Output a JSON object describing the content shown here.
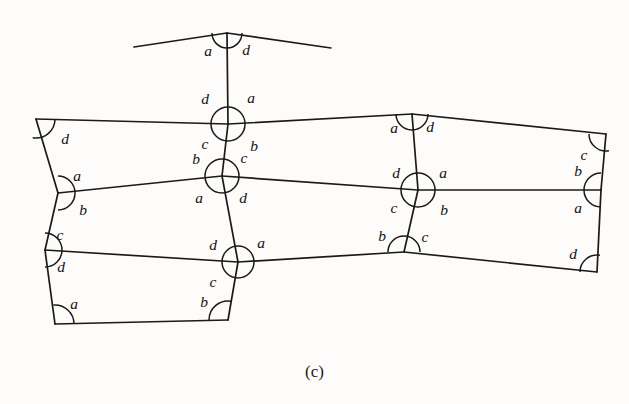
{
  "figure": {
    "caption": "(c)",
    "caption_x": 315,
    "caption_y": 362,
    "width": 629,
    "height": 404,
    "background_color": "#fdfcfa",
    "stroke_color": "#1a1a1a",
    "label_color": "#121212"
  },
  "chart_data": {
    "type": "diagram",
    "title": "(c)",
    "angle_label_set": [
      "a",
      "b",
      "c",
      "d"
    ],
    "nodes": [
      {
        "id": "P",
        "x": 227,
        "y": 33,
        "mark": "semicircle-down",
        "r": 15
      },
      {
        "id": "TL",
        "x": 36,
        "y": 119,
        "mark": "quarter-arc-br",
        "r": 19
      },
      {
        "id": "T1",
        "x": 228,
        "y": 124,
        "mark": "circle",
        "r": 17
      },
      {
        "id": "T2",
        "x": 412,
        "y": 114,
        "mark": "semicircle-down",
        "r": 16
      },
      {
        "id": "TR",
        "x": 606,
        "y": 134,
        "mark": "quarter-arc-bl",
        "r": 17
      },
      {
        "id": "ML",
        "x": 58,
        "y": 193,
        "mark": "semicircle-right",
        "r": 17
      },
      {
        "id": "M1",
        "x": 222,
        "y": 176,
        "mark": "circle",
        "r": 17
      },
      {
        "id": "M2",
        "x": 418,
        "y": 190,
        "mark": "circle",
        "r": 17
      },
      {
        "id": "MR",
        "x": 601,
        "y": 190,
        "mark": "semicircle-left",
        "r": 17
      },
      {
        "id": "BL",
        "x": 45,
        "y": 250,
        "mark": "semicircle-right",
        "r": 17
      },
      {
        "id": "B1",
        "x": 238,
        "y": 262,
        "mark": "circle",
        "r": 16
      },
      {
        "id": "B2",
        "x": 404,
        "y": 252,
        "mark": "semicircle-up",
        "r": 16
      },
      {
        "id": "BR",
        "x": 597,
        "y": 272,
        "mark": "quarter-arc-tl",
        "r": 17
      },
      {
        "id": "BBL",
        "x": 55,
        "y": 324,
        "mark": "quarter-arc-tr",
        "r": 19
      },
      {
        "id": "BBR",
        "x": 228,
        "y": 320,
        "mark": "quarter-arc-tl",
        "r": 19
      }
    ],
    "edges": [
      {
        "from": "peak-left-end",
        "to": "P",
        "x1": 134,
        "y1": 47,
        "x2": 227,
        "y2": 33
      },
      {
        "from": "P",
        "to": "peak-right-end",
        "x1": 227,
        "y1": 33,
        "x2": 331,
        "y2": 48
      },
      {
        "from": "P",
        "to": "T1",
        "x1": 227,
        "y1": 33,
        "x2": 228,
        "y2": 124
      },
      {
        "from": "TL",
        "to": "T1",
        "x1": 36,
        "y1": 119,
        "x2": 228,
        "y2": 124
      },
      {
        "from": "T1",
        "to": "T2",
        "x1": 228,
        "y1": 124,
        "x2": 412,
        "y2": 114
      },
      {
        "from": "T2",
        "to": "TR",
        "x1": 412,
        "y1": 114,
        "x2": 606,
        "y2": 134
      },
      {
        "from": "TL",
        "to": "ML",
        "x1": 36,
        "y1": 119,
        "x2": 58,
        "y2": 193
      },
      {
        "from": "ML",
        "to": "M1",
        "x1": 58,
        "y1": 193,
        "x2": 222,
        "y2": 176
      },
      {
        "from": "M1",
        "to": "M2",
        "x1": 222,
        "y1": 176,
        "x2": 418,
        "y2": 190
      },
      {
        "from": "M2",
        "to": "MR",
        "x1": 418,
        "y1": 190,
        "x2": 601,
        "y2": 190
      },
      {
        "from": "TR",
        "to": "MR",
        "x1": 606,
        "y1": 134,
        "x2": 601,
        "y2": 190
      },
      {
        "from": "T1",
        "to": "M1",
        "x1": 228,
        "y1": 124,
        "x2": 222,
        "y2": 176
      },
      {
        "from": "T2",
        "to": "M2",
        "x1": 412,
        "y1": 114,
        "x2": 418,
        "y2": 190
      },
      {
        "from": "ML",
        "to": "BL",
        "x1": 58,
        "y1": 193,
        "x2": 45,
        "y2": 250
      },
      {
        "from": "BL",
        "to": "B1",
        "x1": 45,
        "y1": 250,
        "x2": 238,
        "y2": 262
      },
      {
        "from": "B1",
        "to": "B2",
        "x1": 238,
        "y1": 262,
        "x2": 404,
        "y2": 252
      },
      {
        "from": "B2",
        "to": "BR",
        "x1": 404,
        "y1": 252,
        "x2": 597,
        "y2": 272
      },
      {
        "from": "MR",
        "to": "BR",
        "x1": 601,
        "y1": 190,
        "x2": 597,
        "y2": 272
      },
      {
        "from": "M1",
        "to": "B1",
        "x1": 222,
        "y1": 176,
        "x2": 238,
        "y2": 262
      },
      {
        "from": "M2",
        "to": "B2",
        "x1": 418,
        "y1": 190,
        "x2": 404,
        "y2": 252
      },
      {
        "from": "BL",
        "to": "BBL",
        "x1": 45,
        "y1": 250,
        "x2": 55,
        "y2": 324
      },
      {
        "from": "BBL",
        "to": "BBR",
        "x1": 55,
        "y1": 324,
        "x2": 228,
        "y2": 320
      },
      {
        "from": "B1",
        "to": "BBR",
        "x1": 238,
        "y1": 262,
        "x2": 228,
        "y2": 320
      }
    ],
    "angle_labels": [
      {
        "text": "a",
        "x": 208,
        "y": 52,
        "node": "P",
        "pos": "left"
      },
      {
        "text": "d",
        "x": 246,
        "y": 51,
        "node": "P",
        "pos": "right"
      },
      {
        "text": "d",
        "x": 65,
        "y": 140,
        "node": "TL",
        "pos": "below-right"
      },
      {
        "text": "d",
        "x": 205,
        "y": 100,
        "node": "T1",
        "pos": "upper-left"
      },
      {
        "text": "a",
        "x": 251,
        "y": 99,
        "node": "T1",
        "pos": "upper-right"
      },
      {
        "text": "c",
        "x": 205,
        "y": 145,
        "node": "T1",
        "pos": "lower-left"
      },
      {
        "text": "b",
        "x": 254,
        "y": 147,
        "node": "T1",
        "pos": "lower-right"
      },
      {
        "text": "a",
        "x": 394,
        "y": 129,
        "node": "T2",
        "pos": "left"
      },
      {
        "text": "d",
        "x": 430,
        "y": 128,
        "node": "T2",
        "pos": "right"
      },
      {
        "text": "c",
        "x": 584,
        "y": 156,
        "node": "TR",
        "pos": "below-left"
      },
      {
        "text": "a",
        "x": 77,
        "y": 177,
        "node": "ML",
        "pos": "above-right"
      },
      {
        "text": "b",
        "x": 83,
        "y": 211,
        "node": "ML",
        "pos": "below-right"
      },
      {
        "text": "b",
        "x": 196,
        "y": 160,
        "node": "M1",
        "pos": "upper-left"
      },
      {
        "text": "c",
        "x": 244,
        "y": 159,
        "node": "M1",
        "pos": "upper-right"
      },
      {
        "text": "a",
        "x": 199,
        "y": 199,
        "node": "M1",
        "pos": "lower-left"
      },
      {
        "text": "d",
        "x": 243,
        "y": 199,
        "node": "M1",
        "pos": "lower-right"
      },
      {
        "text": "d",
        "x": 396,
        "y": 174,
        "node": "M2",
        "pos": "upper-left"
      },
      {
        "text": "a",
        "x": 443,
        "y": 174,
        "node": "M2",
        "pos": "upper-right"
      },
      {
        "text": "c",
        "x": 394,
        "y": 209,
        "node": "M2",
        "pos": "lower-left"
      },
      {
        "text": "b",
        "x": 444,
        "y": 211,
        "node": "M2",
        "pos": "lower-right"
      },
      {
        "text": "b",
        "x": 578,
        "y": 172,
        "node": "MR",
        "pos": "above-left"
      },
      {
        "text": "a",
        "x": 578,
        "y": 209,
        "node": "MR",
        "pos": "below-left"
      },
      {
        "text": "c",
        "x": 60,
        "y": 236,
        "node": "BL",
        "pos": "above-right"
      },
      {
        "text": "d",
        "x": 61,
        "y": 268,
        "node": "BL",
        "pos": "below-right"
      },
      {
        "text": "d",
        "x": 213,
        "y": 246,
        "node": "B1",
        "pos": "upper-left"
      },
      {
        "text": "a",
        "x": 261,
        "y": 244,
        "node": "B1",
        "pos": "upper-right"
      },
      {
        "text": "c",
        "x": 213,
        "y": 283,
        "node": "B1",
        "pos": "lower-left"
      },
      {
        "text": "b",
        "x": 382,
        "y": 237,
        "node": "B2",
        "pos": "left"
      },
      {
        "text": "c",
        "x": 425,
        "y": 238,
        "node": "B2",
        "pos": "right"
      },
      {
        "text": "d",
        "x": 573,
        "y": 255,
        "node": "BR",
        "pos": "above-left"
      },
      {
        "text": "a",
        "x": 74,
        "y": 305,
        "node": "BBL",
        "pos": "above-right"
      },
      {
        "text": "b",
        "x": 204,
        "y": 303,
        "node": "BBR",
        "pos": "above-left"
      }
    ]
  }
}
